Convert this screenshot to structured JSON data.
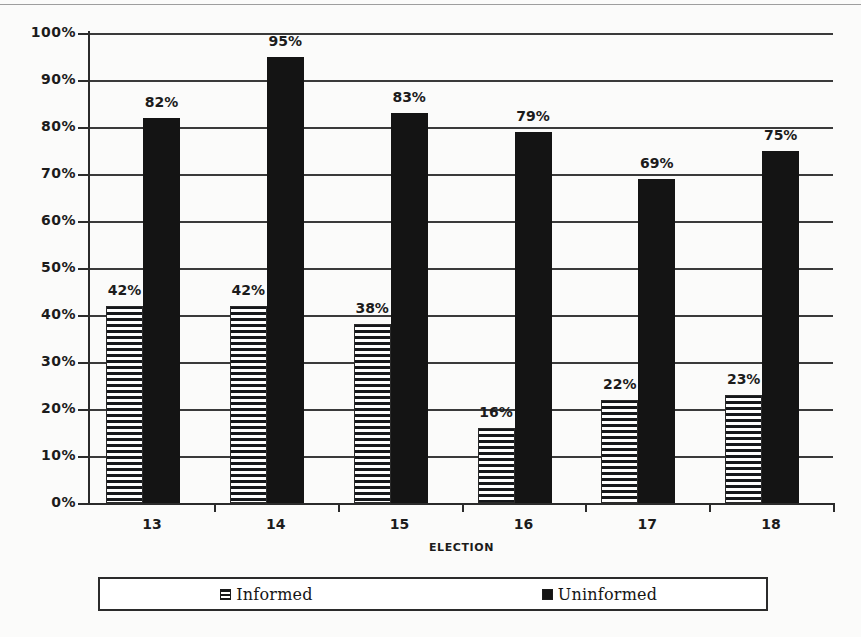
{
  "chart_data": {
    "type": "bar",
    "title": "",
    "xlabel": "ELECTION",
    "ylabel": "",
    "categories": [
      "13",
      "14",
      "15",
      "16",
      "17",
      "18"
    ],
    "series": [
      {
        "name": "Informed",
        "values": [
          42,
          42,
          38,
          16,
          22,
          23
        ]
      },
      {
        "name": "Uninformed",
        "values": [
          82,
          95,
          83,
          79,
          69,
          75
        ]
      }
    ],
    "value_labels": {
      "Informed": [
        "42%",
        "42%",
        "38%",
        "16%",
        "22%",
        "23%"
      ],
      "Uninformed": [
        "82%",
        "95%",
        "83%",
        "79%",
        "69%",
        "75%"
      ]
    },
    "ylim": [
      0,
      100
    ],
    "ytick_values": [
      0,
      10,
      20,
      30,
      40,
      50,
      60,
      70,
      80,
      90,
      100
    ],
    "ytick_labels": [
      "0%",
      "10%",
      "20%",
      "30%",
      "40%",
      "50%",
      "60%",
      "70%",
      "80%",
      "90%",
      "100%"
    ],
    "grid": true,
    "legend_position": "bottom",
    "colors": {
      "informed": "#f2f2f2",
      "informed_pattern": "#15171a",
      "uninformed": "#141414",
      "axis": "#2b2b2b",
      "gridline": "#3a3a3a",
      "text": "#1c1c1c",
      "background": "#fbfbfa"
    }
  },
  "legend": {
    "items": [
      {
        "label": "Informed",
        "swatch": "hatched-swatch"
      },
      {
        "label": "Uninformed",
        "swatch": "solid-swatch"
      }
    ]
  }
}
